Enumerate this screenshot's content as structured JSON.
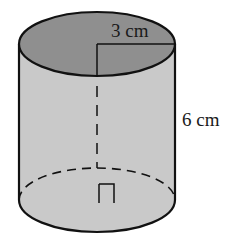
{
  "diagram": {
    "type": "cylinder",
    "radius_label": "3 cm",
    "height_label": "6 cm",
    "right_angle_marker": true,
    "colors": {
      "top_face": "#8f8f8f",
      "body": "#c9c9c9",
      "stroke": "#111111",
      "background": "#ffffff"
    }
  }
}
